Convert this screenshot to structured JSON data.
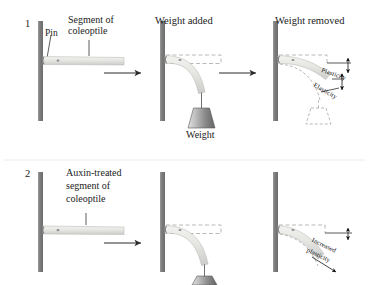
{
  "figure": {
    "rows": [
      {
        "number": "1",
        "panels": [
          {
            "title": "",
            "labels": [
              "Pin",
              "Segment of\ncoleoptile"
            ]
          },
          {
            "title": "Weight added",
            "labels": [
              "Weight"
            ]
          },
          {
            "title": "Weight removed",
            "labels": [
              "Plasticity",
              "Elasticity"
            ]
          }
        ]
      },
      {
        "number": "2",
        "panels": [
          {
            "title": "",
            "labels": [
              "Auxin-treated\nsegment of\ncoleoptile"
            ]
          },
          {
            "title": "",
            "labels": []
          },
          {
            "title": "",
            "labels": [
              "Increased\nplasticity"
            ]
          }
        ]
      }
    ],
    "text": {
      "row1_number": "1",
      "row2_number": "2",
      "pin": "Pin",
      "segment_line1": "Segment of",
      "segment_line2": "coleoptile",
      "weight_added": "Weight added",
      "weight_removed": "Weight removed",
      "weight": "Weight",
      "plasticity": "Plasticity",
      "elasticity": "Elasticity",
      "auxin_line1": "Auxin-treated",
      "auxin_line2": "segment of",
      "auxin_line3": "coleoptile",
      "increased_line1": "Increased",
      "increased_line2": "plasticity"
    },
    "colors": {
      "post": "#8a8a8a",
      "post_dark": "#6f6f6f",
      "coleoptile": "#e2e2e0",
      "coleoptile_edge": "#b9b9b6",
      "weight_light": "#d6d6d6",
      "weight_dark": "#6a6a6a",
      "dashed": "#9b9b9b",
      "arrow": "#2b2b2b",
      "text": "#1f1f1f",
      "background": "#ffffff"
    }
  }
}
